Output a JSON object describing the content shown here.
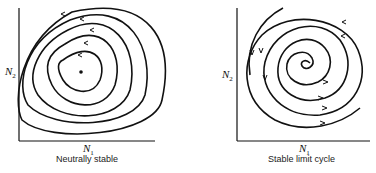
{
  "panels": [
    {
      "title": "Neutrally stable",
      "x_axis": {
        "symbol": "N",
        "subscript": "1"
      },
      "y_axis": {
        "symbol": "N",
        "subscript": "2"
      }
    },
    {
      "title": "Stable limit cycle",
      "x_axis": {
        "symbol": "N",
        "subscript": "1"
      },
      "y_axis": {
        "symbol": "N",
        "subscript": "2"
      }
    }
  ],
  "colors": {
    "ink": "#111111",
    "background": "#ffffff"
  }
}
